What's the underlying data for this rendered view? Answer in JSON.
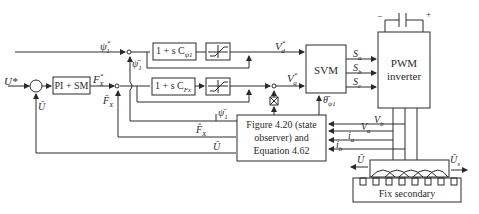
{
  "diagram": {
    "blocks": {
      "pi_sm": "PI + SM",
      "flux_ctrl": "1 + s C",
      "flux_ctrl_sub": "ψ1",
      "force_ctrl": "1 + s C",
      "force_ctrl_sub": "Fx",
      "svm": "SVM",
      "inverter_line1": "PWM",
      "inverter_line2": "inverter",
      "observer_line1": "Figure 4.20 (state",
      "observer_line2": "observer) and",
      "observer_line3": "Equation 4.62",
      "secondary": "Fix secondary"
    },
    "signals": {
      "u_ref": "U*",
      "psi_ref": "ψ",
      "psi_ref_sub": "1",
      "psi_ref_sup": "*",
      "psi_fb": "ψ̄",
      "psi_fb_sub": "1",
      "fx_ref": "F",
      "fx_ref_sub": "X",
      "fx_ref_sup": "*",
      "fx_fb": "F̄",
      "fx_fb_sub": "X",
      "u_fb": "Ū",
      "vd_ref": "V",
      "vd_sub": "d",
      "vq_ref": "V",
      "vq_sub": "q",
      "star": "*",
      "sa": "S",
      "sa_sub": "a",
      "sb": "S",
      "sb_sub": "b",
      "sc": "S",
      "sc_sub": "c",
      "theta": "θ̄",
      "theta_sub": "ψ1",
      "psi_est": "ψ̄",
      "psi_est_sub": "1",
      "fx_est": "F̂",
      "fx_est_sub": "X",
      "u_est": "Ū",
      "vb": "V",
      "vb_sub": "b",
      "va": "V",
      "va_sub": "a",
      "ia": "i",
      "ia_sub": "a",
      "ib": "i",
      "ib_sub": "b",
      "u_motor": "Ū",
      "us_motor": "Ū",
      "us_sub": "s",
      "dc_minus": "−",
      "dc_plus": "+"
    }
  }
}
